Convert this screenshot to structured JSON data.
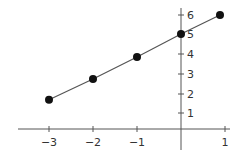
{
  "chart_data": {
    "type": "line",
    "title": "",
    "xlabel": "",
    "ylabel": "",
    "x": [
      -3,
      -2,
      -1,
      0,
      1
    ],
    "series": [
      {
        "name": "line",
        "values": [
          1.7,
          2.75,
          3.85,
          5,
          6
        ]
      }
    ],
    "xticks": [
      -3,
      -2,
      -1,
      1
    ],
    "xtick_labels": [
      "−3",
      "−2",
      "−1",
      "1"
    ],
    "yticks": [
      1,
      2,
      3,
      4,
      5,
      6
    ],
    "ytick_labels": [
      "1",
      "2",
      "3",
      "4",
      "5",
      "6"
    ],
    "xlim": [
      -3.5,
      1.5
    ],
    "ylim": [
      -0.5,
      6.5
    ],
    "grid": false,
    "legend": null,
    "markers": "filled-circle"
  },
  "colors": {
    "axis": "#555555",
    "line": "#555555",
    "marker": "#111111",
    "text": "#333333"
  }
}
